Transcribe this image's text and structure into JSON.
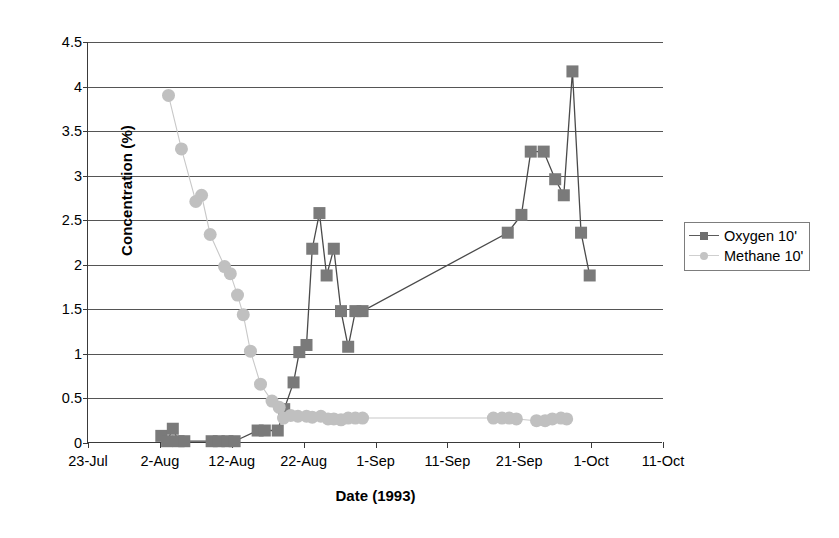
{
  "chart_data": {
    "type": "scatter",
    "title": "",
    "xlabel": "Date (1993)",
    "ylabel": "Concentration (%)",
    "ylim": [
      0,
      4.5
    ],
    "ytick_labels": [
      "0",
      "0.5",
      "1",
      "1.5",
      "2",
      "2.5",
      "3",
      "3.5",
      "4",
      "4.5"
    ],
    "ytick_values": [
      0,
      0.5,
      1,
      1.5,
      2,
      2.5,
      3,
      3.5,
      4,
      4.5
    ],
    "xtick_labels": [
      "23-Jul",
      "2-Aug",
      "12-Aug",
      "22-Aug",
      "1-Sep",
      "11-Sep",
      "21-Sep",
      "1-Oct",
      "11-Oct"
    ],
    "xtick_values": [
      0,
      10,
      20,
      30,
      40,
      50,
      60,
      70,
      80
    ],
    "xlim": [
      0,
      80
    ],
    "grid": "horizontal",
    "legend_position": "right",
    "series": [
      {
        "name": "Oxygen 10'",
        "marker": "square",
        "color": "#7a7a7a",
        "line_color": "#4a4a4a",
        "x": [
          10.2,
          11.0,
          11.8,
          12.6,
          13.4,
          17.2,
          18.2,
          19.4,
          20.4,
          23.6,
          24.6,
          26.4,
          27.3,
          28.6,
          29.4,
          30.4,
          31.2,
          32.2,
          33.2,
          34.2,
          35.2,
          36.2,
          37.2,
          38.2,
          58.4,
          60.3,
          61.6,
          63.4,
          65.0,
          66.2,
          67.4,
          68.6,
          69.8
        ],
        "y": [
          0.08,
          0.02,
          0.16,
          0.02,
          0.02,
          0.02,
          0.02,
          0.02,
          0.02,
          0.14,
          0.14,
          0.14,
          0.38,
          0.68,
          1.02,
          1.1,
          2.18,
          2.58,
          1.88,
          2.18,
          1.48,
          1.08,
          1.48,
          1.48,
          2.36,
          2.56,
          3.27,
          3.27,
          2.96,
          2.78,
          4.17,
          2.36,
          1.88
        ]
      },
      {
        "name": "Methane 10'",
        "marker": "circle",
        "color": "#c0c0c0",
        "line_color": "#c8c8c8",
        "x": [
          11.2,
          13.0,
          15.0,
          15.8,
          17.0,
          19.0,
          19.8,
          20.8,
          21.6,
          22.6,
          24.0,
          25.6,
          26.6,
          27.2,
          28.2,
          29.2,
          30.4,
          31.2,
          32.4,
          33.4,
          34.2,
          35.2,
          36.2,
          37.2,
          38.2,
          56.4,
          57.6,
          58.6,
          59.6,
          62.4,
          63.6,
          64.6,
          65.8,
          66.6
        ],
        "y": [
          3.9,
          3.3,
          2.71,
          2.78,
          2.34,
          1.98,
          1.9,
          1.66,
          1.44,
          1.03,
          0.66,
          0.47,
          0.4,
          0.28,
          0.31,
          0.3,
          0.3,
          0.29,
          0.3,
          0.27,
          0.27,
          0.26,
          0.28,
          0.28,
          0.28,
          0.28,
          0.28,
          0.28,
          0.27,
          0.25,
          0.25,
          0.27,
          0.28,
          0.27
        ]
      }
    ]
  },
  "legend": {
    "items": [
      {
        "label": "Oxygen 10'",
        "color": "#7a7a7a",
        "marker": "square"
      },
      {
        "label": "Methane 10'",
        "color": "#c0c0c0",
        "marker": "circle"
      }
    ]
  },
  "axes": {
    "y_title": "Concentration (%)",
    "x_title": "Date (1993)"
  }
}
